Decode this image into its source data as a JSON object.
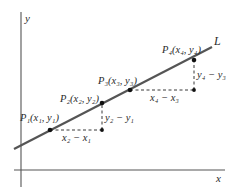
{
  "figure": {
    "axes": {
      "x_label": "x",
      "y_label": "y"
    },
    "line": {
      "label": "L",
      "color": "#555555"
    },
    "points": [
      {
        "name": "P1",
        "label": "P₁(x₁, y₁)"
      },
      {
        "name": "P2",
        "label": "P₂(x₂, y₂)"
      },
      {
        "name": "P3",
        "label": "P₃(x₃, y₃)"
      },
      {
        "name": "P4",
        "label": "P₄(x₄, y₄)"
      }
    ],
    "differences": {
      "run_1": "x₂ − x₁",
      "rise_1": "y₂ − y₁",
      "run_2": "x₄ − x₃",
      "rise_2": "y₄ − y₃"
    },
    "colors": {
      "axis": "#555555",
      "line": "#555555",
      "dashed": "#222222",
      "point": "#111111",
      "text": "#2a2a2a"
    }
  }
}
